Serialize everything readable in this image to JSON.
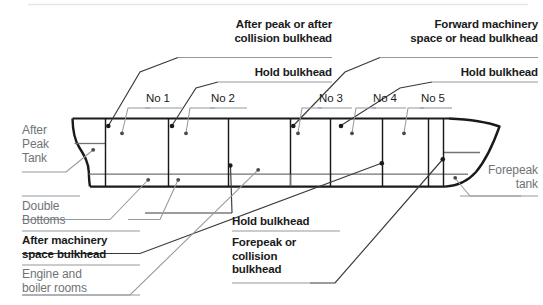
{
  "diagram": {
    "colors": {
      "hull_outline": "#1a1a1a",
      "inner_line": "#6f7376",
      "leader_dark": "#2b2b2b",
      "leader_light": "#8d9194",
      "bold_text": "#1a1a1a",
      "gray_text": "#6f7376",
      "background": "#ffffff",
      "top_rule": "#e4e6ea"
    }
  },
  "callouts": {
    "after_peak": "After peak or after\ncollision bulkhead",
    "hold_bulkhead_left": "Hold bulkhead",
    "forward_machinery": "Forward machinery\nspace or head bulkhead",
    "hold_bulkhead_right": "Hold bulkhead",
    "hold_bulkhead_bottom": "Hold bulkhead",
    "forepeak_or_collision": "Forepeak or\ncollision\nbulkhead",
    "after_machinery": "After machinery\nspace bulkhead"
  },
  "side_labels": {
    "after_peak_tank": "After\nPeak\nTank",
    "double_bottoms": "Double\nBottoms",
    "engine_boiler": "Engine and\nboiler rooms",
    "forepeak_tank": "Forepeak\ntank"
  },
  "holds": [
    {
      "label": "No 1"
    },
    {
      "label": "No 2"
    },
    {
      "label": "No 3"
    },
    {
      "label": "No 4"
    },
    {
      "label": "No 5"
    }
  ]
}
